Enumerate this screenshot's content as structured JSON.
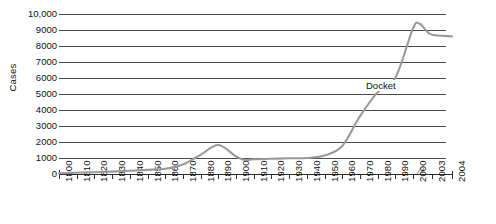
{
  "chart_data": {
    "type": "line",
    "title": "",
    "xlabel": "",
    "ylabel": "Cases",
    "ylim": [
      0,
      10000
    ],
    "grid": true,
    "legend_position": "inline-annotation",
    "y_ticks": [
      "0",
      "1000",
      "2000",
      "3000",
      "4000",
      "5000",
      "6000",
      "7000",
      "8000",
      "9000",
      "10,000"
    ],
    "y_tick_values": [
      0,
      1000,
      2000,
      3000,
      4000,
      5000,
      6000,
      7000,
      8000,
      9000,
      10000
    ],
    "x_ticks": [
      "1800",
      "1810",
      "1820",
      "1830",
      "1840",
      "1850",
      "1860",
      "1870",
      "1880",
      "1890",
      "1900",
      "1910",
      "1920",
      "1930",
      "1940",
      "1950",
      "1960",
      "1970",
      "1980",
      "1990",
      "2000",
      "2003",
      "2004"
    ],
    "axis_break_after": "2000",
    "axis_break_symbol": "//",
    "series": [
      {
        "name": "Docket",
        "color": "#9a9a9a",
        "x": [
          1800,
          1810,
          1820,
          1830,
          1840,
          1850,
          1860,
          1870,
          1880,
          1890,
          1900,
          1905,
          1910,
          1920,
          1930,
          1940,
          1950,
          1960,
          1970,
          1980,
          1990,
          2000,
          2001,
          2002,
          2003,
          2004
        ],
        "values": [
          50,
          80,
          110,
          150,
          200,
          260,
          330,
          600,
          1200,
          1810,
          1100,
          870,
          920,
          950,
          980,
          1000,
          1150,
          1750,
          3600,
          5100,
          6000,
          9100,
          9400,
          9000,
          8700,
          8600
        ]
      }
    ],
    "annotations": [
      {
        "text": "Docket",
        "x": 1975,
        "y": 5500
      }
    ]
  },
  "axis": {
    "y_title": "Cases"
  }
}
